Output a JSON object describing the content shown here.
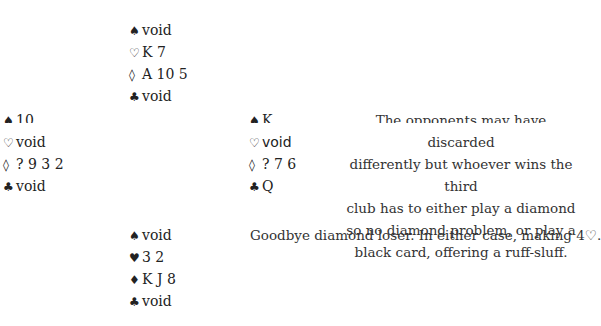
{
  "deal": {
    "north": {
      "spades": {
        "glyph": "♠",
        "cards": "void"
      },
      "hearts": {
        "glyph": "♡",
        "cards": "K 7"
      },
      "diamonds": {
        "glyph": "◊",
        "cards": "A 10 5"
      },
      "clubs": {
        "glyph": "♣",
        "cards": "void"
      }
    },
    "west": {
      "spades": {
        "glyph": "♠",
        "cards": "10"
      },
      "hearts": {
        "glyph": "♡",
        "cards": "void"
      },
      "diamonds": {
        "glyph": "◊",
        "cards": "? 9 3 2"
      },
      "clubs": {
        "glyph": "♣",
        "cards": "void"
      }
    },
    "east": {
      "spades": {
        "glyph": "♠",
        "cards": "K"
      },
      "hearts": {
        "glyph": "♡",
        "cards": "void"
      },
      "diamonds": {
        "glyph": "◊",
        "cards": "? 7 6"
      },
      "clubs": {
        "glyph": "♣",
        "cards": "Q"
      }
    },
    "south": {
      "spades": {
        "glyph": "♠",
        "cards": "void"
      },
      "hearts": {
        "glyph": "♥",
        "cards": "3 2"
      },
      "diamonds": {
        "glyph": "♦",
        "cards": "K J 8"
      },
      "clubs": {
        "glyph": "♣",
        "cards": "void"
      }
    }
  },
  "commentary": {
    "lines": [
      "The opponents may have discarded",
      "differently but whoever wins the third",
      "club has to either play a diamond",
      "so no diamond problem, or play a",
      "black card, offering a ruff-sluff."
    ],
    "conclusion": "Goodbye diamond loser. In either case, making 4♡."
  }
}
